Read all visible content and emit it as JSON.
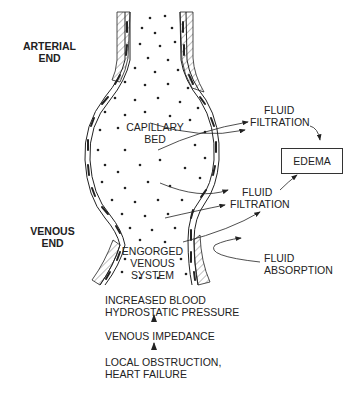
{
  "diagram": {
    "labels": {
      "arterial_end": [
        "ARTERIAL",
        "END"
      ],
      "venous_end": [
        "VENOUS",
        "END"
      ],
      "capillary_bed": [
        "CAPILLARY",
        "BED"
      ],
      "fluid_filtration_1": [
        "FLUID",
        "FILTRATION"
      ],
      "fluid_filtration_2": [
        "FLUID",
        "FILTRATION"
      ],
      "fluid_absorption": [
        "FLUID",
        "ABSORPTION"
      ],
      "edema": "EDEMA",
      "engorged_venous_system": [
        "ENGORGED",
        "VENOUS",
        "SYSTEM"
      ]
    },
    "causal_chain": [
      [
        "INCREASED BLOOD",
        "HYDROSTATIC PRESSURE"
      ],
      [
        "VENOUS IMPEDANCE"
      ],
      [
        "LOCAL OBSTRUCTION,",
        "HEART FAILURE"
      ]
    ],
    "colors": {
      "ink": "#222222",
      "background": "#ffffff"
    }
  }
}
